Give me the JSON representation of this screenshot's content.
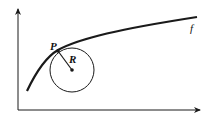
{
  "diagram": {
    "labels": {
      "point": "P",
      "radius": "R",
      "function": "f"
    },
    "colors": {
      "stroke": "#1a1a1a",
      "background": "#ffffff"
    }
  }
}
